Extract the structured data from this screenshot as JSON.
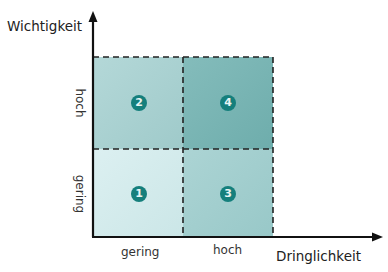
{
  "diagram": {
    "type": "priority-matrix",
    "y_axis": {
      "title": "Wichtigkeit",
      "ticks": [
        "gering",
        "hoch"
      ]
    },
    "x_axis": {
      "title": "Dringlichkeit",
      "ticks": [
        "gering",
        "hoch"
      ]
    },
    "quadrants": [
      {
        "id": "1",
        "label": "1",
        "importance": "gering",
        "urgency": "gering",
        "color": "#d3ebec"
      },
      {
        "id": "2",
        "label": "2",
        "importance": "hoch",
        "urgency": "gering",
        "color": "#a9d1d1"
      },
      {
        "id": "3",
        "label": "3",
        "importance": "gering",
        "urgency": "hoch",
        "color": "#a4cfcf"
      },
      {
        "id": "4",
        "label": "4",
        "importance": "hoch",
        "urgency": "hoch",
        "color": "#78b3b2"
      }
    ],
    "colors": {
      "badge": "#157f7c",
      "axis": "#111111",
      "dash": "#222222"
    }
  }
}
